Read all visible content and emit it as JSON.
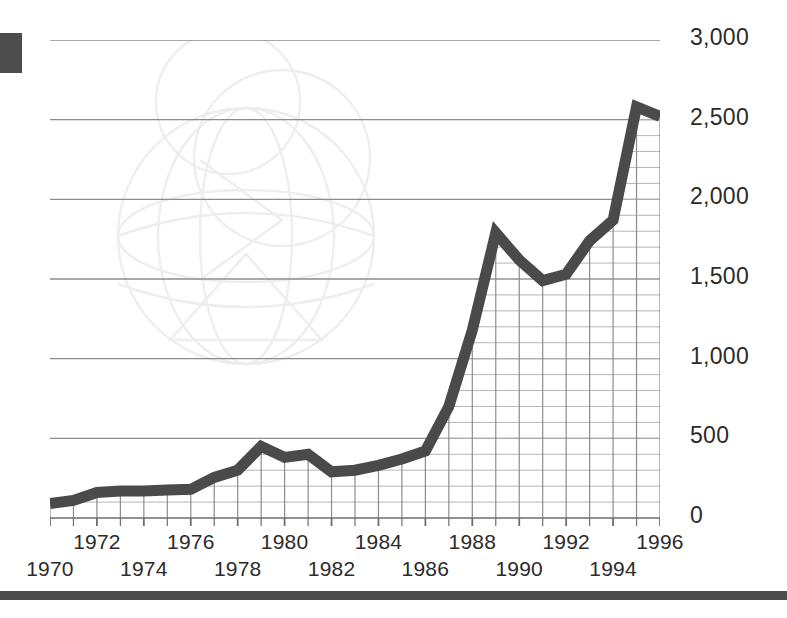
{
  "chart_data": {
    "type": "line",
    "title": "",
    "subtitle": "",
    "xlabel": "",
    "ylabel": "",
    "xlim": [
      1970,
      1996
    ],
    "ylim": [
      0,
      3000
    ],
    "grid": true,
    "legend": "none",
    "y_ticks": [
      0,
      500,
      1000,
      1500,
      2000,
      2500,
      3000
    ],
    "y_tick_labels": [
      "0",
      "500",
      "1,000",
      "1,500",
      "2,000",
      "2,500",
      "3,000"
    ],
    "y_minor_step": 100,
    "x_ticks": [
      1970,
      1971,
      1972,
      1973,
      1974,
      1975,
      1976,
      1977,
      1978,
      1979,
      1980,
      1981,
      1982,
      1983,
      1984,
      1985,
      1986,
      1987,
      1988,
      1989,
      1990,
      1991,
      1992,
      1993,
      1994,
      1995,
      1996
    ],
    "x_tick_labels_top": [
      "1972",
      "1976",
      "1980",
      "1984",
      "1988",
      "1992",
      "1996"
    ],
    "x_tick_labels_bottom": [
      "1970",
      "1974",
      "1978",
      "1982",
      "1986",
      "1990",
      "1994"
    ],
    "x": [
      1970,
      1971,
      1972,
      1973,
      1974,
      1975,
      1976,
      1977,
      1978,
      1979,
      1980,
      1981,
      1982,
      1983,
      1984,
      1985,
      1986,
      1987,
      1988,
      1989,
      1990,
      1991,
      1992,
      1993,
      1994,
      1995,
      1996
    ],
    "values": [
      90,
      110,
      160,
      170,
      170,
      175,
      180,
      255,
      300,
      450,
      380,
      400,
      290,
      300,
      330,
      370,
      420,
      700,
      1180,
      1790,
      1620,
      1490,
      1530,
      1740,
      1870,
      2580,
      2520
    ],
    "series_name": "",
    "line_color": "#4a4a4a",
    "line_width": 11,
    "grid_color": "#8c8c8c",
    "minor_grid_color": "#b5b5b5",
    "axis_color": "#6e6e6e",
    "text_color": "#2b2b2b",
    "accent_block_color": "#4d4d4d",
    "watermark": "globe-outline"
  },
  "decor": {
    "edge_block_name": "left-edge-accent-block",
    "bottom_rule_name": "bottom-rule"
  }
}
